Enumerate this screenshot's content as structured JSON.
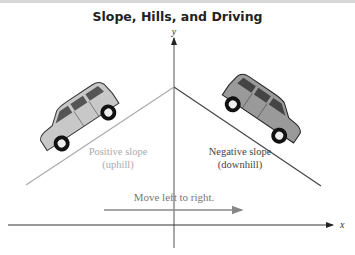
{
  "title": "Slope, Hills, and Driving",
  "axes": {
    "x_label": "x",
    "y_label": "y"
  },
  "left_hill": {
    "label_line1": "Positive slope",
    "label_line2": "(uphill)",
    "color": "#aaaaaa"
  },
  "right_hill": {
    "label_line1": "Negative slope",
    "label_line2": "(downhill)",
    "color": "#444444"
  },
  "direction": {
    "label": "Move left to right.",
    "color": "#888888"
  }
}
